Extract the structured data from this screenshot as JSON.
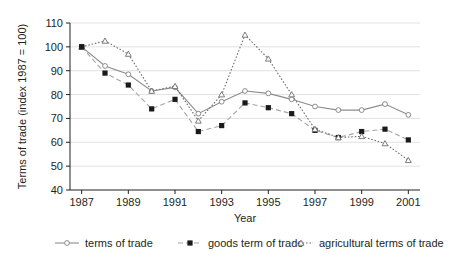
{
  "chart_data": {
    "type": "line",
    "title": "",
    "xlabel": "Year",
    "ylabel": "Terms of trade (index 1987 = 100)",
    "x": [
      1987,
      1988,
      1989,
      1990,
      1991,
      1992,
      1993,
      1994,
      1995,
      1996,
      1997,
      1998,
      1999,
      2000,
      2001
    ],
    "xtick_labels": [
      "1987",
      "1989",
      "1991",
      "1993",
      "1995",
      "1997",
      "1999",
      "2001"
    ],
    "xticks": [
      1987,
      1989,
      1991,
      1993,
      1995,
      1997,
      1999,
      2001
    ],
    "ytick_labels": [
      "40",
      "50",
      "60",
      "70",
      "80",
      "90",
      "100",
      "110"
    ],
    "yticks": [
      40,
      50,
      60,
      70,
      80,
      90,
      100,
      110
    ],
    "ylim": [
      40,
      110
    ],
    "xlim": [
      1986.5,
      2001.5
    ],
    "grid": "horizontal",
    "legend_position": "bottom",
    "series": [
      {
        "name": "terms of trade",
        "style": "solid",
        "marker": "circle",
        "color": "#8c8c8c",
        "values": [
          100,
          92,
          88.5,
          81.5,
          83,
          72,
          77,
          81.5,
          80.5,
          78,
          75,
          73.5,
          73.5,
          76,
          71.5
        ]
      },
      {
        "name": "goods term of trade",
        "style": "dashed",
        "marker": "square",
        "color": "#a6a6a6",
        "values": [
          100,
          89,
          84,
          74,
          78,
          64.5,
          67,
          76.5,
          74.5,
          72,
          65,
          62,
          64.5,
          65.5,
          61
        ]
      },
      {
        "name": "agricultural terms of trade",
        "style": "dotted",
        "marker": "triangle",
        "color": "#6e6e6e",
        "values": [
          100,
          102.5,
          97,
          81.5,
          83.5,
          69,
          80,
          105,
          95,
          80,
          65.5,
          62,
          62.5,
          59.5,
          52.5
        ]
      }
    ]
  },
  "colors": {
    "axis": "#231f20",
    "grid": "#d9d9d9",
    "marker_fill": "#1a1a1a",
    "background": "#ffffff"
  },
  "legend": {
    "items": [
      {
        "label": "terms of trade"
      },
      {
        "label": "goods term of trade"
      },
      {
        "label": "agricultural terms of trade"
      }
    ]
  }
}
